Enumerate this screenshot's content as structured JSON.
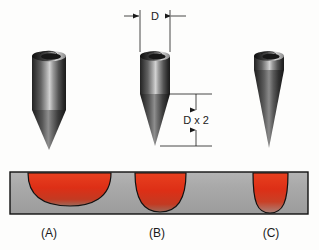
{
  "figure": {
    "background_color": "#fdfdfc"
  },
  "dimensions": [
    {
      "id": "diameter",
      "label": "D",
      "orientation": "horizontal",
      "applies_to": "electrode-b",
      "description": "Electrode body diameter"
    },
    {
      "id": "taper-length",
      "label": "D x 2",
      "orientation": "vertical",
      "applies_to": "electrode-b",
      "description": "Taper length equals twice the electrode diameter"
    }
  ],
  "electrodes": [
    {
      "id": "a",
      "case_label": "(A)",
      "taper": "short blunt taper",
      "body_color_dark": "#1c1c1c",
      "body_color_light": "#c9c9c9"
    },
    {
      "id": "b",
      "case_label": "(B)",
      "taper": "medium taper, length D x 2",
      "body_color_dark": "#1c1c1c",
      "body_color_light": "#c9c9c9"
    },
    {
      "id": "c",
      "case_label": "(C)",
      "taper": "long needle taper from top of body",
      "body_color_dark": "#1c1c1c",
      "body_color_light": "#c9c9c9"
    }
  ],
  "workpiece": {
    "plate_color": "#a8a8a8",
    "plate_edge_color": "#111111",
    "welds": [
      {
        "id": "weld-a",
        "for_electrode": "a",
        "profile": "wide and shallow",
        "fusion_color": "#e03018"
      },
      {
        "id": "weld-b",
        "for_electrode": "b",
        "profile": "balanced width and depth",
        "fusion_color": "#e03018"
      },
      {
        "id": "weld-c",
        "for_electrode": "c",
        "profile": "narrow and deep",
        "fusion_color": "#e03018"
      }
    ]
  },
  "case_labels": {
    "a": "(A)",
    "b": "(B)",
    "c": "(C)"
  }
}
